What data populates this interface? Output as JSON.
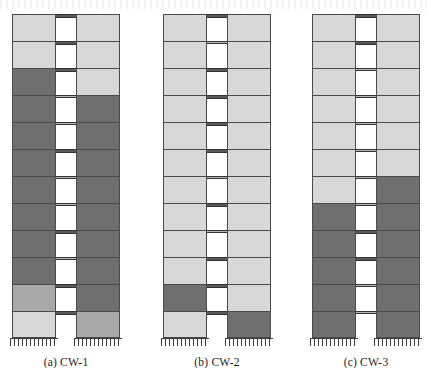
{
  "figure": {
    "colors": {
      "light_gray": "#d8d8d8",
      "mid_gray": "#a9a9a9",
      "dark_gray": "#6f6f6f",
      "coupling_beam": "#5a5a5a",
      "outline": "#4a4a4a",
      "background": "#ffffff"
    },
    "geometry": {
      "stories": 12,
      "pier_width_px": 44,
      "gap_width_px": 20,
      "story_height_px": 27,
      "beam_height_px": 4
    }
  },
  "walls": [
    {
      "id": "cw-1",
      "caption": "(a) CW-1",
      "left_x": 12,
      "caption_x": 12,
      "caption_w": 106,
      "left_pier": [
        "light",
        "light",
        "dark",
        "dark",
        "dark",
        "dark",
        "dark",
        "dark",
        "dark",
        "dark",
        "mid",
        "light"
      ],
      "right_pier": [
        "light",
        "light",
        "light",
        "dark",
        "dark",
        "dark",
        "dark",
        "dark",
        "dark",
        "dark",
        "dark",
        "mid"
      ],
      "coupling_beams": [
        "dark",
        "dark",
        "dark",
        "light",
        "light",
        "dark",
        "light",
        "light",
        "dark",
        "light",
        "dark",
        "dark"
      ]
    },
    {
      "id": "cw-2",
      "caption": "(b) CW-2",
      "left_x": 163,
      "caption_x": 163,
      "caption_w": 106,
      "left_pier": [
        "light",
        "light",
        "light",
        "light",
        "light",
        "light",
        "light",
        "light",
        "light",
        "light",
        "dark",
        "light"
      ],
      "right_pier": [
        "light",
        "light",
        "light",
        "light",
        "light",
        "light",
        "light",
        "light",
        "light",
        "light",
        "light",
        "dark"
      ],
      "coupling_beams": [
        "dark",
        "light",
        "dark",
        "dark",
        "dark",
        "dark",
        "light",
        "dark",
        "light",
        "dark",
        "dark",
        "dark"
      ]
    },
    {
      "id": "cw-3",
      "caption": "(c) CW-3",
      "left_x": 312,
      "caption_x": 312,
      "caption_w": 106,
      "left_pier": [
        "light",
        "light",
        "light",
        "light",
        "light",
        "light",
        "light",
        "dark",
        "dark",
        "dark",
        "dark",
        "dark"
      ],
      "right_pier": [
        "light",
        "light",
        "light",
        "light",
        "light",
        "light",
        "dark",
        "dark",
        "dark",
        "dark",
        "dark",
        "dark"
      ],
      "coupling_beams": [
        "dark",
        "dark",
        "light",
        "light",
        "light",
        "light",
        "light",
        "light",
        "dark",
        "dark",
        "light",
        "light"
      ]
    }
  ]
}
